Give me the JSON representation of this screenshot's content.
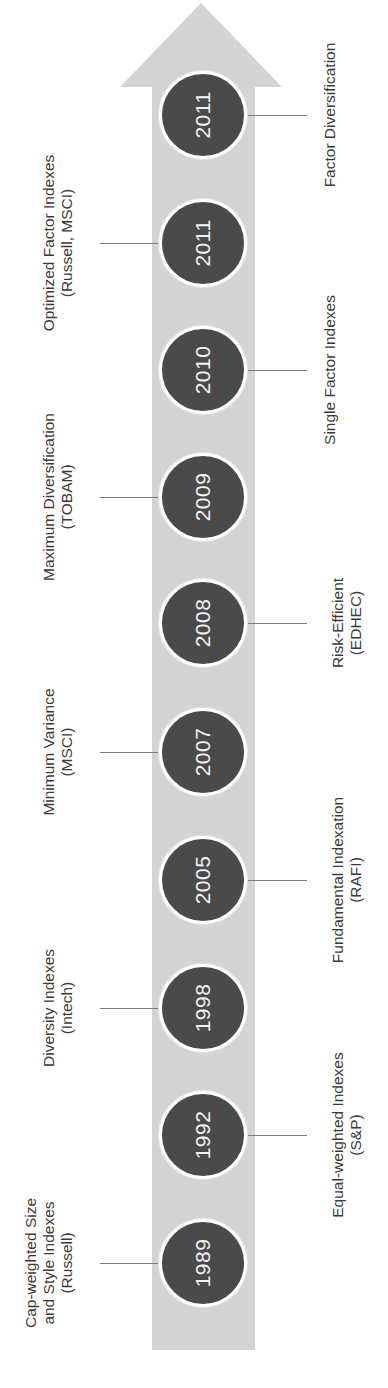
{
  "diagram": {
    "type": "timeline",
    "orientation": "vertical-bottom-to-top (rotated text)",
    "colors": {
      "arrow": "#d4d4d4",
      "node_fill": "#4a4a4a",
      "node_ring": "#ffffff",
      "year_text": "#f2f2f2",
      "label_text": "#3a3a3a",
      "connector": "#7a7a7a"
    },
    "events": [
      {
        "year": "1989",
        "side": "left",
        "label_lines": [
          "Cap-weighted Size",
          "and Style Indexes",
          "(Russell)"
        ]
      },
      {
        "year": "1992",
        "side": "right",
        "label_lines": [
          "Equal-weighted Indexes",
          "(S&P)"
        ]
      },
      {
        "year": "1998",
        "side": "left",
        "label_lines": [
          "Diversity Indexes",
          "(Intech)"
        ]
      },
      {
        "year": "2005",
        "side": "right",
        "label_lines": [
          "Fundamental Indexation",
          "(RAFI)"
        ]
      },
      {
        "year": "2007",
        "side": "left",
        "label_lines": [
          "Minimum Variance",
          "(MSCI)"
        ]
      },
      {
        "year": "2008",
        "side": "right",
        "label_lines": [
          "Risk-Efficient",
          "(EDHEC)"
        ]
      },
      {
        "year": "2009",
        "side": "left",
        "label_lines": [
          "Maximum Diversification",
          "(TOBAM)"
        ]
      },
      {
        "year": "2010",
        "side": "right",
        "label_lines": [
          "Single Factor Indexes"
        ]
      },
      {
        "year": "2011",
        "side": "left",
        "label_lines": [
          "Optimized Factor Indexes",
          "(Russell, MSCI)"
        ]
      },
      {
        "year": "2011",
        "side": "right",
        "label_lines": [
          "Factor Diversification"
        ]
      }
    ]
  }
}
